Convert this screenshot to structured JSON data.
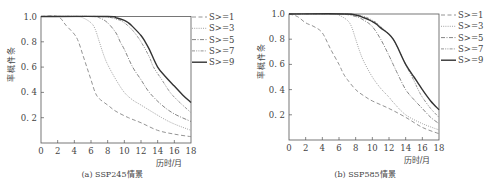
{
  "chart_data": [
    {
      "type": "line",
      "title": "",
      "caption": "(a) SSP245情景",
      "xlabel": "历时/月",
      "ylabel": "条件概率",
      "xlim": [
        0,
        18
      ],
      "ylim": [
        0,
        1.0
      ],
      "xticks": [
        "0",
        "2",
        "4",
        "6",
        "8",
        "10",
        "12",
        "14",
        "16",
        "18"
      ],
      "yticks": [
        "0.2",
        "0.4",
        "0.6",
        "0.8",
        "1.0"
      ],
      "grid": false,
      "legend_position": "right-outside-top",
      "series": [
        {
          "name": "S>=1",
          "style": "dashed",
          "x": [
            0,
            2,
            3,
            4,
            4.5,
            5,
            5.5,
            6,
            6.5,
            7,
            8,
            9,
            10.5,
            12,
            14,
            16,
            18
          ],
          "values": [
            1.0,
            1.0,
            0.93,
            0.86,
            0.8,
            0.7,
            0.6,
            0.5,
            0.4,
            0.35,
            0.3,
            0.25,
            0.2,
            0.16,
            0.1,
            0.07,
            0.05
          ]
        },
        {
          "name": "S>=3",
          "style": "dotted",
          "x": [
            0,
            4,
            5,
            6,
            6.5,
            7,
            7.5,
            8,
            9,
            10,
            11,
            12,
            14.5,
            16,
            18
          ],
          "values": [
            1.0,
            1.0,
            0.99,
            0.95,
            0.9,
            0.8,
            0.7,
            0.62,
            0.5,
            0.4,
            0.34,
            0.3,
            0.2,
            0.15,
            0.1
          ]
        },
        {
          "name": "S>=5",
          "style": "dashdot",
          "x": [
            0,
            6,
            7,
            8,
            9,
            9.5,
            10,
            11,
            12,
            13,
            14.5,
            16,
            18
          ],
          "values": [
            1.0,
            1.0,
            0.99,
            0.95,
            0.87,
            0.8,
            0.74,
            0.6,
            0.5,
            0.4,
            0.3,
            0.23,
            0.17
          ]
        },
        {
          "name": "S>=7",
          "style": "dashdotdot",
          "x": [
            0,
            7,
            9,
            10,
            11,
            12,
            13,
            13.5,
            14.5,
            15.5,
            16.5,
            18
          ],
          "values": [
            1.0,
            1.0,
            0.98,
            0.95,
            0.89,
            0.8,
            0.68,
            0.6,
            0.5,
            0.4,
            0.33,
            0.24
          ]
        },
        {
          "name": "S>=9",
          "style": "solid",
          "x": [
            0,
            8,
            9,
            10,
            10.5,
            11,
            12,
            12.5,
            13,
            14,
            15,
            16,
            17,
            18
          ],
          "values": [
            1.0,
            1.0,
            0.99,
            0.97,
            0.95,
            0.92,
            0.85,
            0.8,
            0.74,
            0.6,
            0.52,
            0.45,
            0.38,
            0.32
          ]
        }
      ]
    },
    {
      "type": "line",
      "title": "",
      "caption": "(b) SSP585情景",
      "xlabel": "历时/月",
      "ylabel": "条件概率",
      "xlim": [
        0,
        18
      ],
      "ylim": [
        0,
        1.0
      ],
      "xticks": [
        "0",
        "2",
        "4",
        "6",
        "8",
        "10",
        "12",
        "14",
        "16",
        "18"
      ],
      "yticks": [
        "0.2",
        "0.4",
        "0.6",
        "0.8",
        "1.0"
      ],
      "grid": false,
      "legend_position": "right-outside-top",
      "series": [
        {
          "name": "S>=1",
          "style": "dashed",
          "x": [
            0,
            1,
            2,
            3,
            4,
            5,
            6,
            6.5,
            7,
            8,
            9,
            10,
            12,
            14,
            16,
            18
          ],
          "values": [
            1.0,
            0.98,
            0.93,
            0.9,
            0.85,
            0.72,
            0.6,
            0.53,
            0.48,
            0.4,
            0.35,
            0.31,
            0.25,
            0.18,
            0.1,
            0.05
          ]
        },
        {
          "name": "S>=3",
          "style": "dotted",
          "x": [
            0,
            5,
            6,
            7,
            7.5,
            8,
            8.5,
            9,
            10,
            11,
            12,
            12.5,
            14,
            16,
            18
          ],
          "values": [
            1.0,
            1.0,
            0.99,
            0.95,
            0.9,
            0.8,
            0.7,
            0.62,
            0.5,
            0.41,
            0.34,
            0.3,
            0.2,
            0.13,
            0.08
          ]
        },
        {
          "name": "S>=5",
          "style": "dashdot",
          "x": [
            0,
            6,
            8,
            9,
            10,
            11,
            12,
            12.5,
            13,
            14,
            15,
            16,
            17,
            18
          ],
          "values": [
            1.0,
            1.0,
            0.98,
            0.95,
            0.9,
            0.8,
            0.67,
            0.6,
            0.53,
            0.4,
            0.32,
            0.25,
            0.18,
            0.13
          ]
        },
        {
          "name": "S>=7",
          "style": "dashdotdot",
          "x": [
            0,
            7,
            9,
            10,
            10.5,
            11,
            12,
            12.5,
            13,
            14,
            15,
            15.5,
            16,
            17,
            18
          ],
          "values": [
            1.0,
            1.0,
            0.98,
            0.95,
            0.93,
            0.9,
            0.84,
            0.8,
            0.74,
            0.6,
            0.47,
            0.4,
            0.34,
            0.25,
            0.18
          ]
        },
        {
          "name": "S>=9",
          "style": "solid",
          "x": [
            0,
            7,
            9,
            10,
            10.5,
            11,
            12,
            12.5,
            13,
            14,
            15,
            15.5,
            16,
            17,
            18
          ],
          "values": [
            1.0,
            1.0,
            0.97,
            0.94,
            0.92,
            0.89,
            0.84,
            0.8,
            0.74,
            0.6,
            0.5,
            0.45,
            0.4,
            0.31,
            0.24
          ]
        }
      ]
    }
  ],
  "panels": [
    {
      "caption": "(a) SSP245情景",
      "xlabel": "历时/月",
      "ylabel": "条件概率",
      "legend": [
        "S>=1",
        "S>=3",
        "S>=5",
        "S>=7",
        "S>=9"
      ]
    },
    {
      "caption": "(b) SSP585情景",
      "xlabel": "历时/月",
      "ylabel": "条件概率",
      "legend": [
        "S>=1",
        "S>=3",
        "S>=5",
        "S>=7",
        "S>=9"
      ]
    }
  ],
  "colors": {
    "axis": "#555555",
    "series": [
      "#888888",
      "#999999",
      "#777777",
      "#888888",
      "#333333"
    ]
  }
}
